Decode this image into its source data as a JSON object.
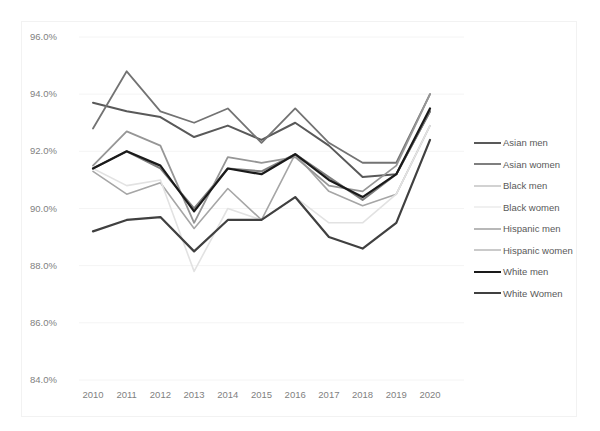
{
  "title": "",
  "axis": {
    "y_ticks": [
      "96.0%",
      "94.0%",
      "92.0%",
      "90.0%",
      "88.0%",
      "86.0%",
      "84.0%"
    ],
    "x_ticks": [
      "2010",
      "2011",
      "2012",
      "2013",
      "2014",
      "2015",
      "2016",
      "2017",
      "2018",
      "2019",
      "2020"
    ]
  },
  "legend": {
    "items": [
      {
        "label": "Asian men",
        "color": "#595959",
        "width": 2.0
      },
      {
        "label": "Asian women",
        "color": "#7f7f7f",
        "width": 2.0
      },
      {
        "label": "Black men",
        "color": "#a6a6a6",
        "width": 1.6
      },
      {
        "label": "Black women",
        "color": "#e2e2e2",
        "width": 1.6
      },
      {
        "label": "Hispanic men",
        "color": "#737373",
        "width": 1.8
      },
      {
        "label": "Hispanic women",
        "color": "#969696",
        "width": 1.8
      },
      {
        "label": "White men",
        "color": "#1a1a1a",
        "width": 2.2
      },
      {
        "label": "White Women",
        "color": "#404040",
        "width": 2.2
      }
    ]
  },
  "chart_data": {
    "type": "line",
    "title": "",
    "xlabel": "",
    "ylabel": "",
    "x": [
      2010,
      2011,
      2012,
      2013,
      2014,
      2015,
      2016,
      2017,
      2018,
      2019,
      2020
    ],
    "ylim": [
      84.0,
      96.0
    ],
    "ytick_values": [
      96.0,
      94.0,
      92.0,
      90.0,
      88.0,
      86.0,
      84.0
    ],
    "grid": true,
    "legend_position": "right",
    "units": "percent",
    "series": [
      {
        "name": "Asian men",
        "color": "#595959",
        "width": 2.0,
        "values": [
          93.7,
          93.4,
          93.2,
          92.5,
          92.9,
          92.4,
          93.0,
          92.2,
          91.1,
          91.2,
          93.4
        ]
      },
      {
        "name": "Asian women",
        "color": "#7f7f7f",
        "width": 2.0,
        "values": [
          91.4,
          92.0,
          91.4,
          90.0,
          91.4,
          91.3,
          91.9,
          91.1,
          90.3,
          91.2,
          93.4
        ]
      },
      {
        "name": "Black men",
        "color": "#a6a6a6",
        "width": 1.6,
        "values": [
          91.3,
          90.5,
          90.9,
          89.3,
          90.7,
          89.6,
          91.9,
          90.6,
          90.1,
          90.5,
          92.9
        ]
      },
      {
        "name": "Black women",
        "color": "#e2e2e2",
        "width": 1.6,
        "values": [
          91.4,
          90.8,
          91.0,
          87.8,
          90.0,
          89.6,
          90.4,
          89.5,
          89.5,
          90.5,
          92.9
        ]
      },
      {
        "name": "Hispanic men",
        "color": "#737373",
        "width": 1.8,
        "values": [
          92.8,
          94.8,
          93.4,
          93.0,
          93.5,
          92.3,
          93.5,
          92.3,
          91.6,
          91.6,
          94.0
        ]
      },
      {
        "name": "Hispanic women",
        "color": "#969696",
        "width": 1.8,
        "values": [
          91.5,
          92.7,
          92.2,
          89.5,
          91.8,
          91.6,
          91.8,
          90.8,
          90.6,
          91.5,
          94.0
        ]
      },
      {
        "name": "White men",
        "color": "#1a1a1a",
        "width": 2.2,
        "values": [
          91.4,
          92.0,
          91.5,
          89.9,
          91.4,
          91.2,
          91.9,
          91.0,
          90.4,
          91.2,
          93.5
        ]
      },
      {
        "name": "White Women",
        "color": "#404040",
        "width": 2.2,
        "values": [
          89.2,
          89.6,
          89.7,
          88.5,
          89.6,
          89.6,
          90.4,
          89.0,
          88.6,
          89.5,
          92.4
        ]
      }
    ]
  },
  "plot_geometry": {
    "x0": 93,
    "x1": 430,
    "y_top": 37,
    "y_bottom": 380,
    "y_top_value": 96.0,
    "y_bottom_value": 84.0
  }
}
